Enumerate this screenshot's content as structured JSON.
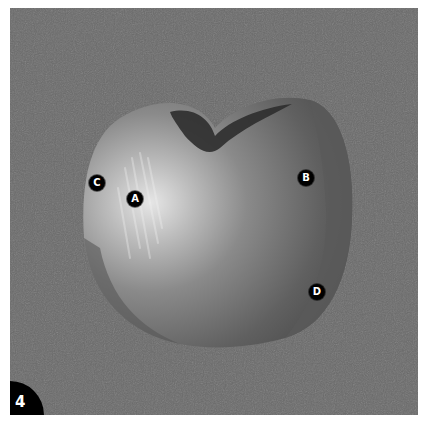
{
  "figure": {
    "step_number": "4",
    "background_color": "#6a6a6a",
    "markers": [
      {
        "label": "A",
        "x": 135,
        "y": 199
      },
      {
        "label": "B",
        "x": 306,
        "y": 178
      },
      {
        "label": "C",
        "x": 97,
        "y": 183
      },
      {
        "label": "D",
        "x": 317,
        "y": 292
      }
    ]
  }
}
